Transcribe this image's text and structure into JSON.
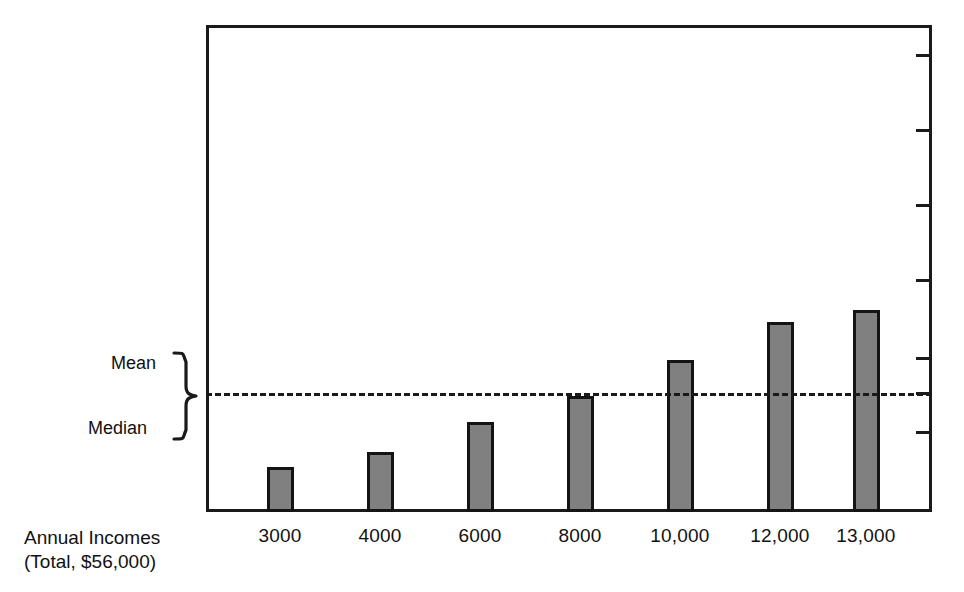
{
  "chart_data": {
    "type": "bar",
    "title": "",
    "subtitle": "",
    "xlabel": "Annual Incomes (Total, $56,000)",
    "ylabel": "",
    "categories": [
      "3000",
      "4000",
      "6000",
      "8000",
      "10,000",
      "12,000",
      "13,000"
    ],
    "values": [
      3000,
      4000,
      6000,
      8000,
      10000,
      12000,
      13000
    ],
    "series": [
      {
        "name": "Annual Incomes",
        "values": [
          3000,
          4000,
          6000,
          8000,
          10000,
          12000,
          13000
        ]
      }
    ],
    "ylim": [
      0,
      16000
    ],
    "grid": false,
    "legend_position": "none",
    "total": "$56,000",
    "annotations": [
      {
        "name": "mean-median-reference",
        "labels": [
          "Mean",
          "Median"
        ],
        "value": 8000,
        "style": "dashed-horizontal-line",
        "note": "Mean and median coincide at the dashed line"
      }
    ],
    "y_axis": {
      "side": "right",
      "tick_labels": [],
      "tick_count": 7
    },
    "colors": {
      "bar_fill": "#808080",
      "bar_stroke": "#141414",
      "axis": "#1a1a1a",
      "background": "#ffffff",
      "text": "#111111"
    }
  },
  "axis_caption": {
    "line1": "Annual Incomes",
    "line2": "(Total, $56,000)"
  },
  "annotations": {
    "mean": "Mean",
    "median": "Median"
  },
  "geometry": {
    "plot": {
      "left": 206,
      "top": 25,
      "right": 932,
      "bottom": 512
    },
    "bars": [
      {
        "category": "3000",
        "center_x": 280,
        "top_y": 467,
        "width": 27
      },
      {
        "category": "4000",
        "center_x": 380,
        "top_y": 452,
        "width": 27
      },
      {
        "category": "6000",
        "center_x": 480,
        "top_y": 422,
        "width": 27
      },
      {
        "category": "8000",
        "center_x": 580,
        "top_y": 396,
        "width": 27
      },
      {
        "category": "10,000",
        "center_x": 680,
        "top_y": 360,
        "width": 27
      },
      {
        "category": "12,000",
        "center_x": 780,
        "top_y": 322,
        "width": 27
      },
      {
        "category": "13,000",
        "center_x": 866,
        "top_y": 310,
        "width": 27
      }
    ],
    "ref_line_y": 393,
    "right_ticks_y": [
      55,
      130,
      205,
      280,
      358,
      393,
      432
    ]
  }
}
